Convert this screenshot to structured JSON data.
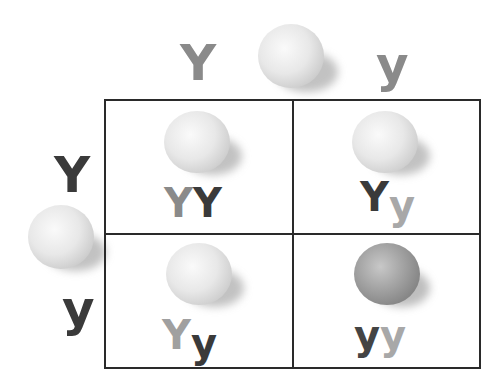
{
  "colors": {
    "dominant_dark": "#3a3a3a",
    "dominant_light": "#8a8a8a",
    "recessive_dark": "#4a4a4a",
    "recessive_light": "#a8a8a8",
    "yellow_pea": "#e6e6e6",
    "green_pea": "#8f8f8f",
    "grid_line": "#2a2a2a"
  },
  "top_parent": {
    "alleles": [
      "Y",
      "y"
    ],
    "pea": "yellow-pea"
  },
  "left_parent": {
    "alleles": [
      "Y",
      "y"
    ],
    "pea": "yellow-pea"
  },
  "cells": [
    {
      "row": 0,
      "col": 0,
      "genotype": [
        "Y",
        "Y"
      ],
      "phenotype": "yellow"
    },
    {
      "row": 0,
      "col": 1,
      "genotype": [
        "Y",
        "y"
      ],
      "phenotype": "yellow"
    },
    {
      "row": 1,
      "col": 0,
      "genotype": [
        "Y",
        "y"
      ],
      "phenotype": "yellow"
    },
    {
      "row": 1,
      "col": 1,
      "genotype": [
        "y",
        "y"
      ],
      "phenotype": "green"
    }
  ]
}
